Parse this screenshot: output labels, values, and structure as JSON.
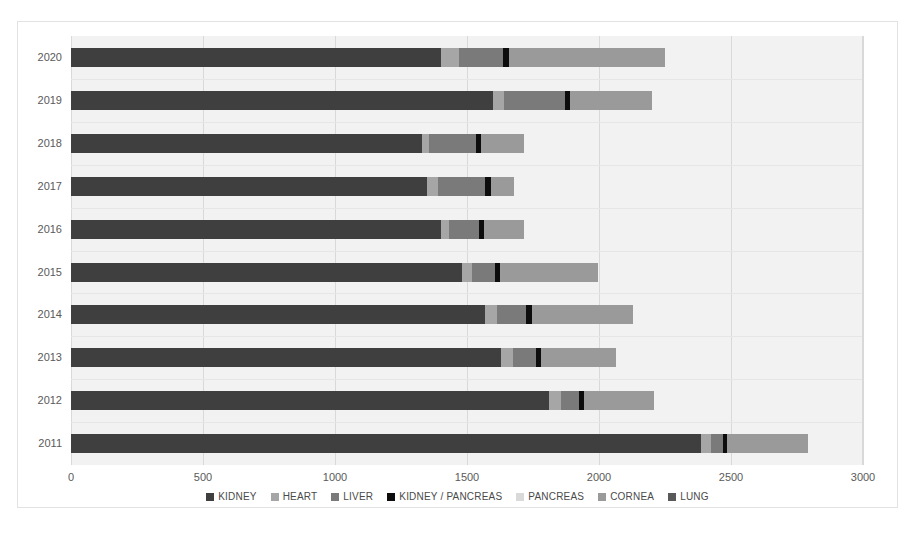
{
  "axis": {
    "x_ticks": [
      "0",
      "500",
      "1000",
      "1500",
      "2000",
      "2500",
      "3000"
    ],
    "y_ticks": [
      "2020",
      "2019",
      "2018",
      "2017",
      "2016",
      "2015",
      "2014",
      "2013",
      "2012",
      "2011"
    ]
  },
  "legend": {
    "items": [
      {
        "label": "KIDNEY",
        "color": "#3f3f3f"
      },
      {
        "label": "HEART",
        "color": "#a6a6a6"
      },
      {
        "label": "LIVER",
        "color": "#7a7a7a"
      },
      {
        "label": "KIDNEY / PANCREAS",
        "color": "#0d0d0d"
      },
      {
        "label": "PANCREAS",
        "color": "#d9d9d9"
      },
      {
        "label": "CORNEA",
        "color": "#9a9a9a"
      },
      {
        "label": "LUNG",
        "color": "#595959"
      }
    ]
  },
  "chart_data": {
    "type": "bar",
    "orientation": "horizontal",
    "stacked": true,
    "title": "",
    "xlabel": "",
    "ylabel": "",
    "xlim": [
      0,
      3000
    ],
    "xtick_step": 500,
    "grid": true,
    "legend_position": "bottom",
    "categories": [
      "2020",
      "2019",
      "2018",
      "2017",
      "2016",
      "2015",
      "2014",
      "2013",
      "2012",
      "2011"
    ],
    "series": [
      {
        "name": "KIDNEY",
        "color": "#3f3f3f",
        "values": [
          1400,
          1600,
          1330,
          1350,
          1400,
          1480,
          1570,
          1630,
          1810,
          2385
        ]
      },
      {
        "name": "HEART",
        "color": "#a6a6a6",
        "values": [
          70,
          40,
          25,
          40,
          30,
          40,
          45,
          45,
          45,
          40
        ]
      },
      {
        "name": "LIVER",
        "color": "#7a7a7a",
        "values": [
          165,
          230,
          180,
          180,
          115,
          85,
          110,
          85,
          70,
          45
        ]
      },
      {
        "name": "KIDNEY / PANCREAS",
        "color": "#0d0d0d",
        "values": [
          25,
          20,
          20,
          20,
          20,
          20,
          20,
          20,
          20,
          15
        ]
      },
      {
        "name": "PANCREAS",
        "color": "#d9d9d9",
        "values": [
          0,
          0,
          0,
          0,
          0,
          0,
          0,
          0,
          0,
          0
        ]
      },
      {
        "name": "CORNEA",
        "color": "#9a9a9a",
        "values": [
          590,
          310,
          160,
          90,
          150,
          370,
          385,
          285,
          265,
          305
        ]
      },
      {
        "name": "LUNG",
        "color": "#595959",
        "values": [
          0,
          0,
          0,
          0,
          0,
          0,
          0,
          0,
          0,
          0
        ]
      }
    ],
    "totals": [
      2250,
      2200,
      1715,
      1680,
      1715,
      1995,
      2130,
      2065,
      2210,
      2790
    ]
  }
}
